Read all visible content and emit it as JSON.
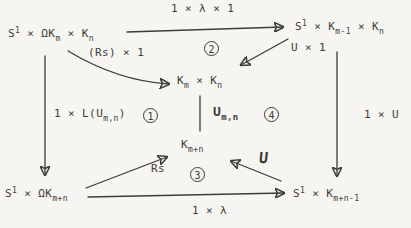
{
  "colors": {
    "ink": "#3d3c38",
    "paper": "#f6f5f1"
  },
  "nodes": {
    "top_left": {
      "base1": "S",
      "sup": "1",
      "base2": " × ΩK",
      "sub1": "m",
      "base3": " × K",
      "sub2": "n"
    },
    "top_right": {
      "base1": "S",
      "sup": "1",
      "base2": " × K",
      "sub1": "m-1",
      "base3": " × K",
      "sub2": "n"
    },
    "center": {
      "base1": "K",
      "sub1": "m",
      "base2": " × K",
      "sub2": "n"
    },
    "mid_lower": {
      "base1": "K",
      "sub1": "m+n"
    },
    "bottom_left": {
      "base1": "S",
      "sup": "1",
      "base2": " × ΩK",
      "sub1": "m+n"
    },
    "bottom_right": {
      "base1": "S",
      "sup": "1",
      "base2": " × K",
      "sub1": "m+n-1"
    }
  },
  "labels": {
    "top": "1 × λ × 1",
    "rs_times_1": "(Rs) × 1",
    "u_times_1": "U × 1",
    "left_pre": "1 × L(U",
    "left_sub": "m,n",
    "left_post": ")",
    "middle_u": "U",
    "middle_u_sub": "m,n",
    "right": "1 × U",
    "rs": "Rs",
    "u": "U",
    "bottom": "1 × λ"
  },
  "steps": {
    "c1": "1",
    "c2": "2",
    "c3": "3",
    "c4": "4"
  }
}
